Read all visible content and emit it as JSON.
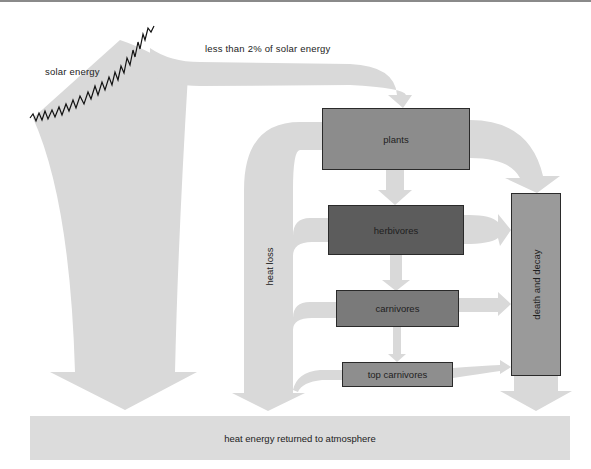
{
  "diagram": {
    "labels": {
      "solar_energy": "solar energy",
      "less_than_2": "less than 2% of solar energy",
      "heat_loss": "heat loss",
      "heat_returned": "heat energy returned to atmosphere"
    },
    "boxes": {
      "plants": "plants",
      "herbivores": "herbivores",
      "carnivores": "carnivores",
      "top_carnivores": "top carnivores",
      "death_and_decay": "death and decay"
    },
    "colors": {
      "flow": "#d9d9d9",
      "plants": "#8c8c8c",
      "herbivores": "#5c5c5c",
      "carnivores": "#7a7a7a",
      "top_carnivores": "#8e8e8e",
      "death_and_decay": "#9a9a9a",
      "bottom_bar": "#dcdcdc"
    },
    "nodes": [
      {
        "id": "plants",
        "label": "plants"
      },
      {
        "id": "herbivores",
        "label": "herbivores"
      },
      {
        "id": "carnivores",
        "label": "carnivores"
      },
      {
        "id": "top_carnivores",
        "label": "top carnivores"
      },
      {
        "id": "death_and_decay",
        "label": "death and decay"
      },
      {
        "id": "atmosphere",
        "label": "heat energy returned to atmosphere"
      }
    ],
    "edges": [
      {
        "from": "solar energy",
        "to": "atmosphere"
      },
      {
        "from": "solar energy",
        "to": "plants",
        "label": "less than 2% of solar energy"
      },
      {
        "from": "plants",
        "to": "herbivores"
      },
      {
        "from": "herbivores",
        "to": "carnivores"
      },
      {
        "from": "carnivores",
        "to": "top_carnivores"
      },
      {
        "from": "plants",
        "to": "death_and_decay"
      },
      {
        "from": "herbivores",
        "to": "death_and_decay"
      },
      {
        "from": "carnivores",
        "to": "death_and_decay"
      },
      {
        "from": "top_carnivores",
        "to": "death_and_decay"
      },
      {
        "from": "plants",
        "to": "heat loss"
      },
      {
        "from": "herbivores",
        "to": "heat loss"
      },
      {
        "from": "carnivores",
        "to": "heat loss"
      },
      {
        "from": "top_carnivores",
        "to": "heat loss"
      },
      {
        "from": "heat loss",
        "to": "atmosphere"
      },
      {
        "from": "death_and_decay",
        "to": "atmosphere"
      }
    ]
  }
}
